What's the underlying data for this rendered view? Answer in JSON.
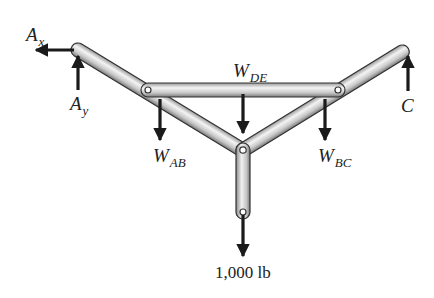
{
  "diagram": {
    "colors": {
      "background": "#ffffff",
      "member_fill_light": "#f2f2f2",
      "member_fill_dark": "#8a8a8a",
      "member_outline": "#333333",
      "arrow": "#1a1a1a",
      "text": "#222222"
    },
    "forces": [
      {
        "id": "Ax",
        "symbol": "A",
        "subscript": "x",
        "direction": "left"
      },
      {
        "id": "Ay",
        "symbol": "A",
        "subscript": "y",
        "direction": "up"
      },
      {
        "id": "WDE",
        "symbol": "W",
        "subscript": "DE",
        "direction": "down"
      },
      {
        "id": "WAB",
        "symbol": "W",
        "subscript": "AB",
        "direction": "down"
      },
      {
        "id": "WBC",
        "symbol": "W",
        "subscript": "BC",
        "direction": "down"
      },
      {
        "id": "C",
        "symbol": "C",
        "subscript": "",
        "direction": "up"
      },
      {
        "id": "load",
        "symbol": "1,000 lb",
        "subscript": "",
        "direction": "down"
      }
    ],
    "labels": {
      "ax_main": "A",
      "ax_sub": "x",
      "ay_main": "A",
      "ay_sub": "y",
      "wde_main": "W",
      "wde_sub": "DE",
      "wab_main": "W",
      "wab_sub": "AB",
      "wbc_main": "W",
      "wbc_sub": "BC",
      "c_main": "C",
      "load": "1,000 lb"
    },
    "members": [
      "AB",
      "BC",
      "DE",
      "vertical hanger"
    ]
  }
}
